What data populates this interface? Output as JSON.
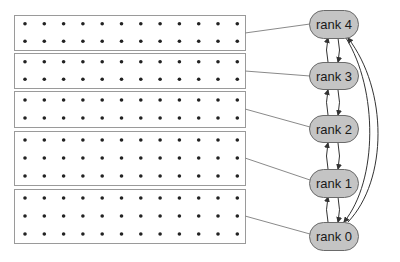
{
  "diagram": {
    "grid_columns": 12,
    "blocks": [
      {
        "rank": 4,
        "rows": 2,
        "y": 15,
        "height": 35
      },
      {
        "rank": 3,
        "rows": 2,
        "y": 53,
        "height": 35
      },
      {
        "rank": 2,
        "rows": 2,
        "y": 91,
        "height": 36
      },
      {
        "rank": 1,
        "rows": 3,
        "y": 131,
        "height": 54
      },
      {
        "rank": 0,
        "rows": 3,
        "y": 189,
        "height": 54
      }
    ],
    "nodes": [
      {
        "label": "rank 4",
        "cy": 24
      },
      {
        "label": "rank 3",
        "cy": 76
      },
      {
        "label": "rank 2",
        "cy": 129
      },
      {
        "label": "rank 1",
        "cy": 183
      },
      {
        "label": "rank 0",
        "cy": 236
      }
    ],
    "edges": [
      {
        "from": "rank 4",
        "to": "rank 3",
        "bidirectional": true
      },
      {
        "from": "rank 3",
        "to": "rank 2",
        "bidirectional": true
      },
      {
        "from": "rank 2",
        "to": "rank 1",
        "bidirectional": true
      },
      {
        "from": "rank 1",
        "to": "rank 0",
        "bidirectional": true
      },
      {
        "from": "rank 4",
        "to": "rank 0",
        "bidirectional": true,
        "curved": true
      }
    ],
    "colors": {
      "node_fill": "#c4c4c4",
      "node_stroke": "#6a6a6a",
      "box_stroke": "#9a9a9a",
      "dot": "#222222"
    }
  }
}
